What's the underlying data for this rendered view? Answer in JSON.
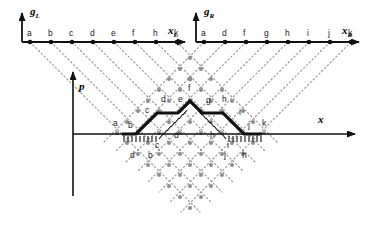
{
  "figure": {
    "background": "#ffffff",
    "ink": "#111111",
    "dot_color": "#8a8a8a",
    "grid_color": "#9a9a9a",
    "width": 374,
    "height": 230
  },
  "axes": {
    "left": {
      "vertical_label": "g",
      "vertical_sub": "L",
      "horizontal_label": "x",
      "horizontal_sub": "L",
      "ticks": [
        "a",
        "b",
        "c",
        "d",
        "e",
        "f",
        "h",
        "k"
      ],
      "origin_x": 22,
      "origin_y": 42,
      "tick_xs": [
        30,
        51,
        72,
        93,
        114,
        135,
        156,
        177
      ],
      "end_x": 185
    },
    "right": {
      "vertical_label": "g",
      "vertical_sub": "R",
      "horizontal_label": "x",
      "horizontal_sub": "R",
      "ticks": [
        "a",
        "d",
        "f",
        "g",
        "h",
        "i",
        "j",
        "k"
      ],
      "origin_x": 196,
      "origin_y": 42,
      "tick_xs": [
        204,
        225,
        246,
        267,
        288,
        309,
        330,
        351
      ],
      "end_x": 359
    },
    "main": {
      "vertical_label": "p",
      "horizontal_label": "x",
      "origin_x": 73,
      "origin_y": 134,
      "x_end": 355,
      "p_top": 72,
      "p_bottom": 196
    }
  },
  "lattice": {
    "apex_left_x": 30,
    "apex_right_x": 351,
    "axis_y": 42,
    "bottom_vertex_x": 190,
    "bottom_vertex_y": 212,
    "spacing": 21,
    "description": "dotted diagonals descending from each left-axis tick (slope down-right) and each right-axis tick (slope down-left), intersecting in a diamond grid of node dots"
  },
  "path": {
    "stroke_width": 3,
    "points": [
      {
        "x": 122,
        "y": 134
      },
      {
        "x": 136,
        "y": 134
      },
      {
        "x": 157,
        "y": 113
      },
      {
        "x": 178,
        "y": 113
      },
      {
        "x": 190,
        "y": 101
      },
      {
        "x": 202,
        "y": 113
      },
      {
        "x": 223,
        "y": 113
      },
      {
        "x": 244,
        "y": 134
      },
      {
        "x": 262,
        "y": 134
      }
    ],
    "labels_upper": [
      {
        "text": "a",
        "x": 115,
        "y": 124
      },
      {
        "text": "b",
        "x": 130,
        "y": 126
      },
      {
        "text": "c",
        "x": 147,
        "y": 111
      },
      {
        "text": "d",
        "x": 163,
        "y": 100
      },
      {
        "text": "e",
        "x": 180,
        "y": 100
      },
      {
        "text": "f",
        "x": 190,
        "y": 89
      },
      {
        "text": "g",
        "x": 208,
        "y": 101
      },
      {
        "text": "h",
        "x": 224,
        "y": 100
      },
      {
        "text": "i",
        "x": 240,
        "y": 113
      },
      {
        "text": "j",
        "x": 249,
        "y": 126
      },
      {
        "text": "k",
        "x": 264,
        "y": 124
      }
    ],
    "labels_lower": [
      {
        "text": "c",
        "x": 157,
        "y": 145
      },
      {
        "text": "d",
        "x": 176,
        "y": 136
      },
      {
        "text": "h",
        "x": 212,
        "y": 136
      },
      {
        "text": "i",
        "x": 228,
        "y": 145
      },
      {
        "text": "d",
        "x": 132,
        "y": 155
      },
      {
        "text": "b",
        "x": 150,
        "y": 155
      },
      {
        "text": "j",
        "x": 225,
        "y": 155
      },
      {
        "text": "h",
        "x": 243,
        "y": 155
      }
    ],
    "hatch_runs": [
      {
        "x1": 122,
        "y1": 140,
        "x2": 158,
        "y2": 140,
        "kind": "horizontal-hatch-left"
      },
      {
        "x1": 227,
        "y1": 140,
        "x2": 262,
        "y2": 140,
        "kind": "horizontal-hatch-right"
      },
      {
        "x1": 158,
        "y1": 140,
        "x2": 190,
        "y2": 110,
        "kind": "diagonal-hatch-left"
      },
      {
        "x1": 190,
        "y1": 110,
        "x2": 227,
        "y2": 140,
        "kind": "diagonal-hatch-right"
      }
    ]
  }
}
